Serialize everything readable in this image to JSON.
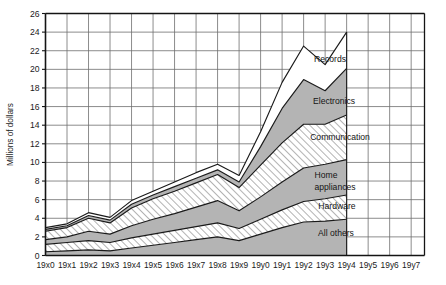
{
  "chart_data": {
    "type": "area",
    "title": "",
    "subtitle": "",
    "xlabel": "",
    "ylabel": "Millions of dollars",
    "stacked": true,
    "grid": true,
    "legend_position": "inline-labels",
    "ylim": [
      0,
      26
    ],
    "ytick_step": 2,
    "yticks": [
      0,
      2,
      4,
      6,
      8,
      10,
      12,
      14,
      16,
      18,
      20,
      22,
      24,
      26
    ],
    "ytick_labels": [
      "0",
      "2",
      "4",
      "6",
      "8",
      "10",
      "12",
      "14",
      "16",
      "18",
      "20",
      "22",
      "24",
      "26"
    ],
    "categories": [
      "19x0",
      "19x1",
      "19x2",
      "19x3",
      "19x4",
      "19x5",
      "19x6",
      "19x7",
      "19x8",
      "19x9",
      "19y0",
      "19y1",
      "19y2",
      "19y3",
      "19y4",
      "19y5",
      "19y6",
      "19y7"
    ],
    "x_axis_extends_past_data": true,
    "last_data_category": "19y4",
    "series": [
      {
        "name": "All others",
        "pattern": "solid-gray",
        "color": "#b4b4b4",
        "values": [
          0.4,
          0.5,
          0.6,
          0.5,
          0.8,
          1.1,
          1.4,
          1.7,
          2.0,
          1.6,
          2.3,
          3.0,
          3.6,
          3.7,
          3.9,
          null,
          null,
          null
        ]
      },
      {
        "name": "Hardware",
        "pattern": "diagonal-hatch",
        "color": "#ffffff",
        "values": [
          0.8,
          0.9,
          1.0,
          0.9,
          1.1,
          1.2,
          1.3,
          1.4,
          1.5,
          1.3,
          1.6,
          1.9,
          2.2,
          2.4,
          2.6,
          null,
          null,
          null
        ]
      },
      {
        "name": "Home appliances",
        "pattern": "solid-gray",
        "color": "#b4b4b4",
        "values": [
          0.5,
          0.6,
          1.0,
          0.9,
          1.3,
          1.6,
          1.8,
          2.1,
          2.4,
          1.9,
          2.4,
          3.0,
          3.6,
          3.7,
          3.8,
          null,
          null,
          null
        ]
      },
      {
        "name": "Communication",
        "pattern": "diagonal-hatch",
        "color": "#ffffff",
        "values": [
          0.9,
          1.0,
          1.4,
          1.2,
          1.9,
          2.2,
          2.4,
          2.6,
          2.8,
          2.5,
          3.4,
          4.2,
          4.7,
          4.3,
          4.8,
          null,
          null,
          null
        ]
      },
      {
        "name": "Electronics",
        "pattern": "solid-gray",
        "color": "#b4b4b4",
        "values": [
          0.2,
          0.2,
          0.3,
          0.3,
          0.4,
          0.4,
          0.5,
          0.5,
          0.5,
          0.6,
          2.0,
          3.7,
          4.8,
          3.6,
          5.0,
          null,
          null,
          null
        ]
      },
      {
        "name": "Records",
        "pattern": "white",
        "color": "#ffffff",
        "values": [
          0.2,
          0.2,
          0.3,
          0.3,
          0.4,
          0.4,
          0.5,
          0.6,
          0.6,
          0.7,
          1.6,
          2.8,
          3.6,
          2.8,
          3.9,
          null,
          null,
          null
        ]
      }
    ],
    "totals": [
      3.0,
      3.4,
      4.6,
      4.1,
      5.9,
      6.9,
      7.9,
      8.9,
      9.8,
      8.6,
      13.3,
      18.6,
      22.5,
      20.5,
      24.0,
      null,
      null,
      null
    ]
  },
  "series_labels": [
    {
      "text": "Records",
      "key": "records"
    },
    {
      "text": "Electronics",
      "key": "electronics"
    },
    {
      "text": "Communication",
      "key": "communication"
    },
    {
      "text": "Home",
      "key": "home"
    },
    {
      "text": "appliances",
      "key": "appliances"
    },
    {
      "text": "Hardware",
      "key": "hardware"
    },
    {
      "text": "All others",
      "key": "all-others"
    }
  ],
  "colors": {
    "gray_fill": "#b4b4b4",
    "white_fill": "#ffffff",
    "line": "#1a1a1a",
    "grid": "#6e6e6e",
    "axis": "#141414",
    "text": "#1a1a1a"
  }
}
